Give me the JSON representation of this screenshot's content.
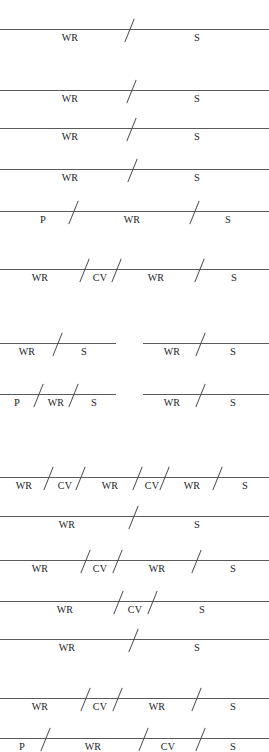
{
  "figure": {
    "label_glossary": {
      "WR": "WR",
      "CV": "CV",
      "S": "S",
      "P": "P"
    },
    "colors": {
      "line": "#595a5c",
      "tick": "#4a4b4d",
      "text": "#1d1d1f",
      "background": "#ffffff"
    },
    "canvas": {
      "width": 269,
      "height": 752
    },
    "groups": [
      {
        "name": "group-1",
        "rows": [
          {
            "name": "row-1",
            "y": 29,
            "x": 0,
            "width": 269,
            "ticks": [
              129
            ],
            "segments": [
              {
                "label": "WR",
                "center": 70
              },
              {
                "label": "S",
                "center": 197
              }
            ]
          },
          {
            "name": "row-2",
            "y": 90,
            "x": 0,
            "width": 269,
            "ticks": [
              131
            ],
            "segments": [
              {
                "label": "WR",
                "center": 70
              },
              {
                "label": "S",
                "center": 197
              }
            ]
          },
          {
            "name": "row-3",
            "y": 128,
            "x": 0,
            "width": 269,
            "ticks": [
              131
            ],
            "segments": [
              {
                "label": "WR",
                "center": 70
              },
              {
                "label": "S",
                "center": 197
              }
            ]
          },
          {
            "name": "row-4",
            "y": 169,
            "x": 0,
            "width": 269,
            "ticks": [
              132
            ],
            "segments": [
              {
                "label": "WR",
                "center": 70
              },
              {
                "label": "S",
                "center": 197
              }
            ]
          },
          {
            "name": "row-5",
            "y": 211,
            "x": 0,
            "width": 269,
            "ticks": [
              73,
              194
            ],
            "segments": [
              {
                "label": "P",
                "center": 43
              },
              {
                "label": "WR",
                "center": 132
              },
              {
                "label": "S",
                "center": 228
              }
            ]
          }
        ]
      },
      {
        "name": "group-2",
        "rows": [
          {
            "name": "row-6",
            "y": 269,
            "x": 0,
            "width": 269,
            "ticks": [
              84,
              116,
              199
            ],
            "segments": [
              {
                "label": "WR",
                "center": 40
              },
              {
                "label": "CV",
                "center": 100
              },
              {
                "label": "WR",
                "center": 156
              },
              {
                "label": "S",
                "center": 234
              }
            ]
          }
        ]
      },
      {
        "name": "group-3-paired",
        "rows": [
          {
            "name": "row-7-left",
            "y": 343,
            "x": 0,
            "width": 116,
            "ticks": [
              57
            ],
            "segments": [
              {
                "label": "WR",
                "center": 27
              },
              {
                "label": "S",
                "center": 84
              }
            ]
          },
          {
            "name": "row-7-right",
            "y": 343,
            "x": 143,
            "width": 126,
            "ticks": [
              200
            ],
            "segments": [
              {
                "label": "WR",
                "center": 172
              },
              {
                "label": "S",
                "center": 233
              }
            ]
          },
          {
            "name": "row-8-left",
            "y": 394,
            "x": 0,
            "width": 116,
            "ticks": [
              38,
              73
            ],
            "segments": [
              {
                "label": "P",
                "center": 17
              },
              {
                "label": "WR",
                "center": 56
              },
              {
                "label": "S",
                "center": 94
              }
            ]
          },
          {
            "name": "row-8-right",
            "y": 394,
            "x": 143,
            "width": 126,
            "ticks": [
              200
            ],
            "segments": [
              {
                "label": "WR",
                "center": 172
              },
              {
                "label": "S",
                "center": 233
              }
            ]
          }
        ]
      },
      {
        "name": "group-4",
        "rows": [
          {
            "name": "row-9",
            "y": 477,
            "x": 0,
            "width": 269,
            "ticks": [
              48,
              80,
              137,
              164,
              217
            ],
            "segments": [
              {
                "label": "WR",
                "center": 24
              },
              {
                "label": "CV",
                "center": 65
              },
              {
                "label": "WR",
                "center": 110
              },
              {
                "label": "CV",
                "center": 152
              },
              {
                "label": "WR",
                "center": 192
              },
              {
                "label": "S",
                "center": 245
              }
            ]
          },
          {
            "name": "row-10",
            "y": 516,
            "x": 0,
            "width": 269,
            "ticks": [
              133
            ],
            "segments": [
              {
                "label": "WR",
                "center": 67
              },
              {
                "label": "S",
                "center": 197
              }
            ]
          },
          {
            "name": "row-11",
            "y": 560,
            "x": 0,
            "width": 269,
            "ticks": [
              85,
              117,
              196
            ],
            "segments": [
              {
                "label": "WR",
                "center": 40
              },
              {
                "label": "CV",
                "center": 100
              },
              {
                "label": "WR",
                "center": 157
              },
              {
                "label": "S",
                "center": 233
              }
            ]
          },
          {
            "name": "row-12",
            "y": 601,
            "x": 0,
            "width": 269,
            "ticks": [
              118,
              152
            ],
            "segments": [
              {
                "label": "WR",
                "center": 65
              },
              {
                "label": "CV",
                "center": 135
              },
              {
                "label": "S",
                "center": 202
              }
            ]
          },
          {
            "name": "row-13",
            "y": 639,
            "x": 0,
            "width": 269,
            "ticks": [
              133
            ],
            "segments": [
              {
                "label": "WR",
                "center": 67
              },
              {
                "label": "S",
                "center": 197
              }
            ]
          }
        ]
      },
      {
        "name": "group-5",
        "rows": [
          {
            "name": "row-14",
            "y": 698,
            "x": 0,
            "width": 269,
            "ticks": [
              85,
              117,
              196
            ],
            "segments": [
              {
                "label": "WR",
                "center": 40
              },
              {
                "label": "CV",
                "center": 100
              },
              {
                "label": "WR",
                "center": 157
              },
              {
                "label": "S",
                "center": 233
              }
            ]
          },
          {
            "name": "row-15",
            "y": 738,
            "x": 0,
            "width": 269,
            "ticks": [
              45,
              143,
              200
            ],
            "segments": [
              {
                "label": "P",
                "center": 22
              },
              {
                "label": "WR",
                "center": 93
              },
              {
                "label": "CV",
                "center": 168
              },
              {
                "label": "S",
                "center": 233
              }
            ]
          }
        ]
      }
    ]
  }
}
